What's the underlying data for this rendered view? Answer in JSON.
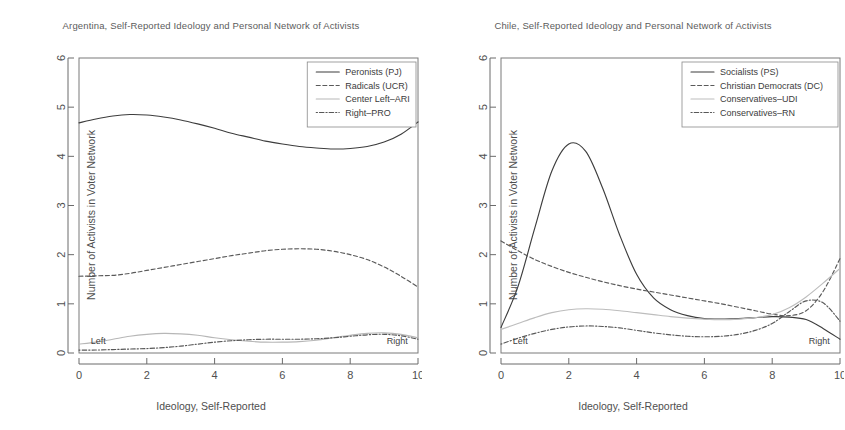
{
  "figure": {
    "width": 845,
    "height": 430,
    "background": "#ffffff",
    "ink_color": "#4a4a4a"
  },
  "chart_data": [
    {
      "type": "line",
      "panel": "left",
      "title": "Argentina, Self-Reported Ideology and Personal Network of Activists",
      "xlabel": "Ideology, Self-Reported",
      "ylabel": "Number of Activists in Voter Network",
      "xlim": [
        0,
        10
      ],
      "ylim": [
        0,
        6
      ],
      "xticks": [
        0,
        2,
        4,
        6,
        8,
        10
      ],
      "yticks": [
        0,
        1,
        2,
        3,
        4,
        5,
        6
      ],
      "grid": false,
      "legend_position": "top-right",
      "annotations": [
        {
          "text": "Left",
          "x": 0.35,
          "y": 0.18,
          "align": "left"
        },
        {
          "text": "Right",
          "x": 9.7,
          "y": 0.18,
          "align": "right"
        }
      ],
      "x": [
        0,
        0.5,
        1,
        1.5,
        2,
        2.5,
        3,
        3.5,
        4,
        4.5,
        5,
        5.5,
        6,
        6.5,
        7,
        7.5,
        8,
        8.5,
        9,
        9.5,
        10
      ],
      "series": [
        {
          "name": "Peronists (PJ)",
          "style": "solid",
          "color": "#3d3d3d",
          "values": [
            4.68,
            4.76,
            4.82,
            4.85,
            4.84,
            4.8,
            4.74,
            4.66,
            4.57,
            4.47,
            4.39,
            4.31,
            4.25,
            4.2,
            4.17,
            4.15,
            4.16,
            4.2,
            4.29,
            4.45,
            4.7
          ]
        },
        {
          "name": "Radicals (UCR)",
          "style": "dashed",
          "color": "#5a5a5a",
          "values": [
            1.56,
            1.57,
            1.58,
            1.62,
            1.68,
            1.74,
            1.8,
            1.86,
            1.92,
            1.98,
            2.03,
            2.08,
            2.11,
            2.12,
            2.11,
            2.07,
            2.0,
            1.9,
            1.75,
            1.56,
            1.34
          ]
        },
        {
          "name": "Center Left–ARI",
          "style": "solid-light",
          "color": "#b7b7b7",
          "values": [
            0.18,
            0.22,
            0.28,
            0.34,
            0.38,
            0.4,
            0.39,
            0.36,
            0.31,
            0.27,
            0.24,
            0.22,
            0.22,
            0.23,
            0.26,
            0.31,
            0.36,
            0.4,
            0.41,
            0.38,
            0.31
          ]
        },
        {
          "name": "Right–PRO",
          "style": "dotdash",
          "color": "#585858",
          "values": [
            0.06,
            0.06,
            0.07,
            0.08,
            0.09,
            0.11,
            0.14,
            0.18,
            0.22,
            0.25,
            0.27,
            0.28,
            0.28,
            0.28,
            0.29,
            0.31,
            0.34,
            0.37,
            0.38,
            0.35,
            0.28
          ]
        }
      ]
    },
    {
      "type": "line",
      "panel": "right",
      "title": "Chile, Self-Reported Ideology and Personal Network of Activists",
      "xlabel": "Ideology, Self-Reported",
      "ylabel": "Number of Activists in Voter Network",
      "xlim": [
        0,
        10
      ],
      "ylim": [
        0,
        6
      ],
      "xticks": [
        0,
        2,
        4,
        6,
        8,
        10
      ],
      "yticks": [
        0,
        1,
        2,
        3,
        4,
        5,
        6
      ],
      "grid": false,
      "legend_position": "top-right",
      "annotations": [
        {
          "text": "Left",
          "x": 0.35,
          "y": 0.18,
          "align": "left"
        },
        {
          "text": "Right",
          "x": 9.7,
          "y": 0.18,
          "align": "right"
        }
      ],
      "x": [
        0,
        0.5,
        1,
        1.5,
        2,
        2.5,
        3,
        3.5,
        4,
        4.5,
        5,
        5.5,
        6,
        6.5,
        7,
        7.5,
        8,
        8.5,
        9,
        9.5,
        10
      ],
      "series": [
        {
          "name": "Socialists (PS)",
          "style": "solid",
          "color": "#3d3d3d",
          "values": [
            0.52,
            1.35,
            2.55,
            3.7,
            4.25,
            4.1,
            3.35,
            2.4,
            1.6,
            1.12,
            0.88,
            0.76,
            0.7,
            0.69,
            0.7,
            0.72,
            0.74,
            0.73,
            0.68,
            0.5,
            0.28
          ]
        },
        {
          "name": "Christian Democrats (DC)",
          "style": "dashed",
          "color": "#5a5a5a",
          "values": [
            2.28,
            2.08,
            1.9,
            1.76,
            1.64,
            1.54,
            1.45,
            1.37,
            1.3,
            1.24,
            1.18,
            1.12,
            1.06,
            1.0,
            0.93,
            0.86,
            0.79,
            0.76,
            0.86,
            1.25,
            1.92
          ]
        },
        {
          "name": "Conservatives–UDI",
          "style": "solid-light",
          "color": "#bdbdbd",
          "values": [
            0.48,
            0.6,
            0.72,
            0.82,
            0.88,
            0.9,
            0.89,
            0.86,
            0.82,
            0.78,
            0.74,
            0.71,
            0.69,
            0.68,
            0.69,
            0.72,
            0.78,
            0.92,
            1.14,
            1.42,
            1.72
          ]
        },
        {
          "name": "Conservatives–RN",
          "style": "dotdash",
          "color": "#585858",
          "values": [
            0.18,
            0.3,
            0.4,
            0.48,
            0.53,
            0.55,
            0.54,
            0.51,
            0.46,
            0.41,
            0.37,
            0.34,
            0.33,
            0.34,
            0.38,
            0.46,
            0.6,
            0.84,
            1.06,
            1.02,
            0.65
          ]
        }
      ]
    }
  ],
  "left_panel": {
    "title": "Argentina, Self-Reported Ideology and Personal Network of Activists",
    "xlabel": "Ideology, Self-Reported",
    "ylabel": "Number of Activists in Voter Network",
    "left_annotation": "Left",
    "right_annotation": "Right",
    "legend": [
      "Peronists (PJ)",
      "Radicals (UCR)",
      "Center Left–ARI",
      "Right–PRO"
    ],
    "xticks": [
      "0",
      "2",
      "4",
      "6",
      "8",
      "10"
    ],
    "yticks": [
      "0",
      "1",
      "2",
      "3",
      "4",
      "5",
      "6"
    ]
  },
  "right_panel": {
    "title": "Chile, Self-Reported Ideology and Personal Network of Activists",
    "xlabel": "Ideology, Self-Reported",
    "ylabel": "Number of Activists in Voter Network",
    "left_annotation": "Left",
    "right_annotation": "Right",
    "legend": [
      "Socialists (PS)",
      "Christian Democrats (DC)",
      "Conservatives–UDI",
      "Conservatives–RN"
    ],
    "xticks": [
      "0",
      "2",
      "4",
      "6",
      "8",
      "10"
    ],
    "yticks": [
      "0",
      "1",
      "2",
      "3",
      "4",
      "5",
      "6"
    ]
  }
}
